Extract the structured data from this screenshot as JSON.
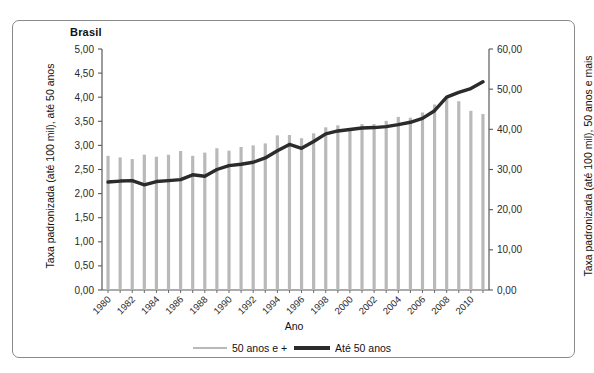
{
  "chart_title": "Brasil",
  "axes": {
    "x_label": "Ano",
    "y_left_label": "Taxa padronizada (até 100 mil), até 50 anos",
    "y_right_label": "Taxa padronizada (até 100 mil), 50 anos e mais",
    "y_left_ticks": [
      "0,00",
      "0,50",
      "1,00",
      "1,50",
      "2,00",
      "2,50",
      "3,00",
      "3,50",
      "4,00",
      "4,50",
      "5,00"
    ],
    "y_right_ticks": [
      "0,00",
      "10,00",
      "20,00",
      "30,00",
      "40,00",
      "50,00",
      "60,00"
    ],
    "x_ticks": [
      "1980",
      "1982",
      "1984",
      "1986",
      "1988",
      "1990",
      "1992",
      "1994",
      "1996",
      "1998",
      "2000",
      "2002",
      "2004",
      "2006",
      "2008",
      "2010"
    ]
  },
  "legend": {
    "items": [
      {
        "label": "50 anos e +",
        "color": "#b9b9b9",
        "style": "thin-line"
      },
      {
        "label": "Até 50 anos",
        "color": "#2b2b2b",
        "style": "thick-line"
      }
    ]
  },
  "colors": {
    "bars": "#b9b9b9",
    "line": "#2b2b2b",
    "axis": "#5a5a5a",
    "frame": "#8a8a8a",
    "background": "#ffffff"
  },
  "chart_data": {
    "type": "bar",
    "title": "Brasil",
    "xlabel": "Ano",
    "ylabel": "Taxa padronizada (até 100 mil), até 50 anos",
    "y2label": "Taxa padronizada (até 100 mil), 50 anos e mais",
    "ylim": [
      0,
      5
    ],
    "y2lim": [
      0,
      60
    ],
    "grid": false,
    "legend_position": "bottom",
    "categories": [
      1980,
      1981,
      1982,
      1983,
      1984,
      1985,
      1986,
      1987,
      1988,
      1989,
      1990,
      1991,
      1992,
      1993,
      1994,
      1995,
      1996,
      1997,
      1998,
      1999,
      2000,
      2001,
      2002,
      2003,
      2004,
      2005,
      2006,
      2007,
      2008,
      2009,
      2010,
      2011
    ],
    "series": [
      {
        "name": "50 anos e +",
        "type": "bar",
        "axis": "right",
        "units": "por 100 mil",
        "values": [
          33.4,
          33.0,
          32.6,
          33.7,
          33.2,
          33.7,
          34.6,
          33.4,
          34.2,
          35.3,
          34.7,
          35.6,
          36.0,
          36.5,
          38.5,
          38.6,
          37.8,
          39.0,
          40.5,
          41.0,
          40.0,
          41.3,
          41.3,
          42.1,
          43.1,
          42.9,
          44.2,
          46.2,
          48.2,
          47.0,
          44.6,
          43.8
        ]
      },
      {
        "name": "Até 50 anos",
        "type": "line",
        "axis": "left",
        "units": "por 100 mil",
        "values": [
          2.24,
          2.26,
          2.27,
          2.18,
          2.25,
          2.27,
          2.29,
          2.39,
          2.36,
          2.5,
          2.58,
          2.61,
          2.65,
          2.74,
          2.89,
          3.02,
          2.94,
          3.08,
          3.24,
          3.3,
          3.33,
          3.36,
          3.37,
          3.39,
          3.43,
          3.48,
          3.56,
          3.72,
          4.0,
          4.1,
          4.18,
          4.32
        ]
      }
    ]
  }
}
